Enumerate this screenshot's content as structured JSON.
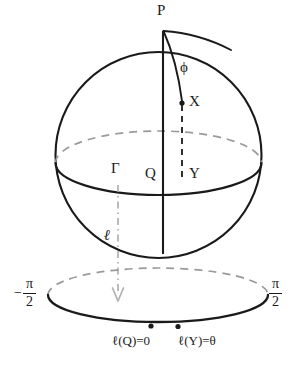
{
  "figure": {
    "domain_type": "diagram"
  },
  "labels": {
    "pole": "P",
    "angle": "ϕ",
    "point_on_sphere": "X",
    "point_on_equator": "Y",
    "equator_origin": "Q",
    "equator_curve": "Γ",
    "map_name": "ℓ",
    "value_at_Q": "ℓ(Q)=0",
    "value_at_Y": "ℓ(Y)=θ"
  },
  "axis_endpoints": {
    "left": {
      "sign": "−",
      "numerator": "π",
      "denominator": "2"
    },
    "right": {
      "sign": "",
      "numerator": "π",
      "denominator": "2"
    }
  },
  "colors": {
    "stroke": "#1a1a1a",
    "hidden_stroke": "#9a9a9a",
    "background": "#ffffff"
  },
  "geometry": {
    "sphere": {
      "cx": 158.5,
      "cy": 155,
      "r": 103
    },
    "equator": {
      "cx": 158.5,
      "cy": 163,
      "rx": 103,
      "ry": 32
    },
    "interval_ellipse": {
      "cx": 158,
      "cy": 295,
      "rx": 110,
      "ry": 27
    },
    "points": {
      "P": {
        "x": 163,
        "y": 31
      },
      "X": {
        "x": 182,
        "y": 103
      },
      "Y": {
        "x": 182,
        "y": 176
      },
      "Q": {
        "x": 163,
        "y": 176
      },
      "lQ_dot": {
        "x": 151,
        "y": 326
      },
      "lY_dot": {
        "x": 178,
        "y": 327
      }
    },
    "projection_arrow": {
      "x": 118,
      "y_start": 185,
      "y_end": 301
    }
  }
}
